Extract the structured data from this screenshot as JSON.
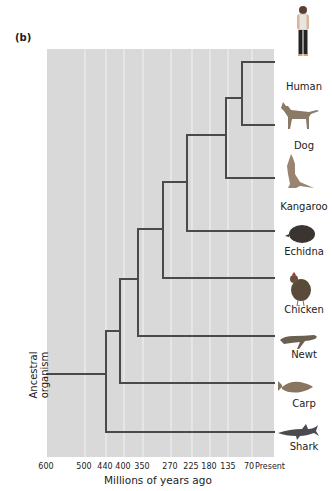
{
  "figure": {
    "panel_label": "(b)",
    "root_label": "Ancestral organism",
    "axis_title": "Millions of years ago",
    "colors": {
      "background_panel": "#d9d9d9",
      "grid": "#f2f2f2",
      "branch": "#4a4a4a"
    }
  },
  "axis": {
    "ticks": [
      {
        "label": "600",
        "value": 600,
        "x": 46
      },
      {
        "label": "500",
        "value": 500,
        "x": 84
      },
      {
        "label": "440",
        "value": 440,
        "x": 105
      },
      {
        "label": "400",
        "value": 400,
        "x": 123
      },
      {
        "label": "350",
        "value": 350,
        "x": 142
      },
      {
        "label": "270",
        "value": 270,
        "x": 170
      },
      {
        "label": "225",
        "value": 225,
        "x": 191
      },
      {
        "label": "180",
        "value": 180,
        "x": 209
      },
      {
        "label": "135",
        "value": 135,
        "x": 228
      },
      {
        "label": "70",
        "value": 70,
        "x": 249
      },
      {
        "label": "Present",
        "value": 0,
        "x": 270
      }
    ]
  },
  "taxa": [
    {
      "name": "Human",
      "icon": "human-icon",
      "y": 62
    },
    {
      "name": "Dog",
      "icon": "dog-icon",
      "y": 125
    },
    {
      "name": "Kangaroo",
      "icon": "kangaroo-icon",
      "y": 178
    },
    {
      "name": "Echidna",
      "icon": "echidna-icon",
      "y": 231
    },
    {
      "name": "Chicken",
      "icon": "chicken-icon",
      "y": 278
    },
    {
      "name": "Newt",
      "icon": "newt-icon",
      "y": 336
    },
    {
      "name": "Carp",
      "icon": "carp-icon",
      "y": 383
    },
    {
      "name": "Shark",
      "icon": "shark-icon",
      "y": 432
    }
  ],
  "divergences_mya": [
    {
      "node": "Shark vs. rest",
      "mya": 440
    },
    {
      "node": "Carp vs. tetrapods",
      "mya": 400
    },
    {
      "node": "Newt vs. amniotes",
      "mya": 350
    },
    {
      "node": "Chicken vs. mammals",
      "mya": 270
    },
    {
      "node": "Echidna vs. therians",
      "mya": 225
    },
    {
      "node": "Kangaroo vs. placentals",
      "mya": 135
    },
    {
      "node": "Human vs. Dog",
      "mya": 70
    }
  ]
}
